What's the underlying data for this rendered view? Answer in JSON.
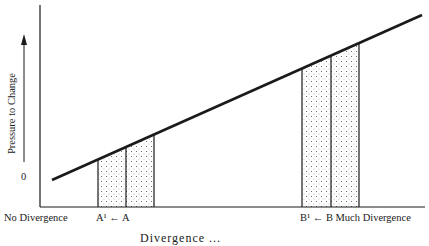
{
  "diagram": {
    "y_axis_label": "Pressure to Change",
    "y_origin_label": "0",
    "x_left_label": "No Divergence",
    "a_label": "A¹ ← A",
    "b_label": "B¹ ← B Much Divergence",
    "caption": "Divergence ...",
    "line": {
      "x1": 52,
      "y1": 180,
      "x2": 422,
      "y2": 15
    },
    "shaded_regions": [
      {
        "name": "A-region",
        "bars_x": [
          98,
          126,
          154
        ]
      },
      {
        "name": "B-region",
        "bars_x": [
          302,
          331,
          359
        ]
      }
    ],
    "colors": {
      "ink": "#1a1a1a",
      "stipple": "#555555",
      "background": "#ffffff"
    }
  }
}
